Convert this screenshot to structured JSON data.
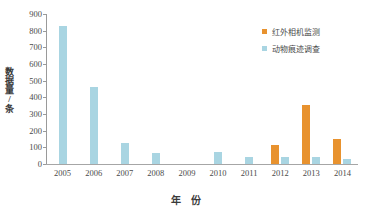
{
  "chart_data": {
    "type": "bar",
    "title": "",
    "xlabel": "年　份",
    "ylabel": "数据量/条",
    "categories": [
      "2005",
      "2006",
      "2007",
      "2008",
      "2009",
      "2010",
      "2011",
      "2012",
      "2013",
      "2014"
    ],
    "series": [
      {
        "name": "红外相机监测",
        "color": "#E8922E",
        "values": [
          0,
          0,
          0,
          0,
          0,
          0,
          0,
          115,
          355,
          152
        ]
      },
      {
        "name": "动物痕迹调查",
        "color": "#A9D5E2",
        "values": [
          830,
          465,
          125,
          68,
          0,
          72,
          40,
          40,
          40,
          30
        ]
      }
    ],
    "ylim": [
      0,
      900
    ],
    "ytick_labels": [
      "900",
      "800",
      "700",
      "600",
      "500",
      "400",
      "300",
      "200",
      "100",
      "0"
    ],
    "ytick_values": [
      900,
      800,
      700,
      600,
      500,
      400,
      300,
      200,
      100,
      0
    ],
    "grid": false,
    "legend_position": "top-right"
  }
}
